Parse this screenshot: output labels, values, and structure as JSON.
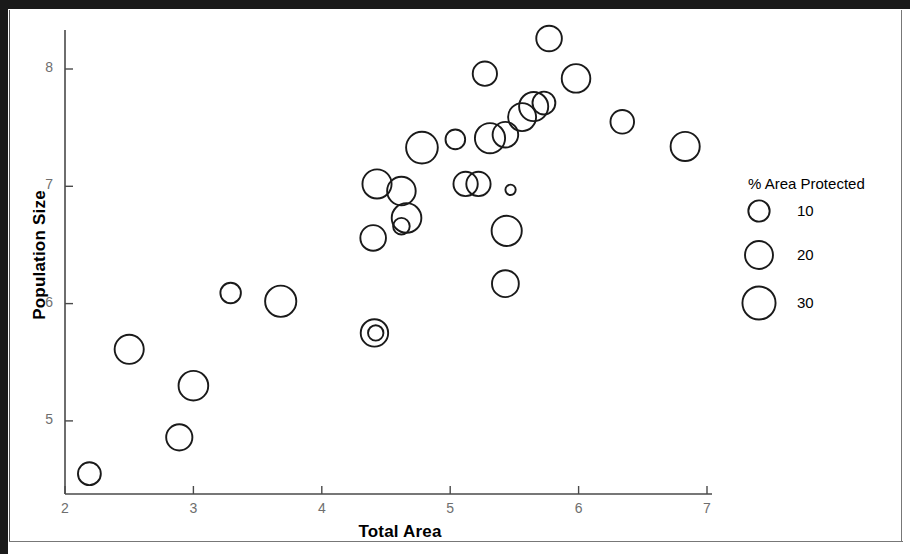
{
  "chart_data": {
    "type": "scatter",
    "title": "",
    "xlabel": "Total Area",
    "ylabel": "Population Size",
    "xlim": [
      1.85,
      7.3
    ],
    "ylim": [
      4.4,
      8.45
    ],
    "xticks": [
      2,
      3,
      4,
      5,
      6,
      7
    ],
    "yticks": [
      5,
      6,
      7,
      8
    ],
    "grid": false,
    "marker": "open-circle",
    "size_legend": {
      "title": "% Area Protected",
      "values": [
        10,
        20,
        30
      ],
      "position": "right"
    },
    "size_field": "% Area Protected",
    "points": [
      {
        "x": 2.19,
        "y": 4.55,
        "size": 12
      },
      {
        "x": 2.5,
        "y": 5.61,
        "size": 22
      },
      {
        "x": 2.89,
        "y": 4.86,
        "size": 17
      },
      {
        "x": 3.0,
        "y": 5.3,
        "size": 23
      },
      {
        "x": 3.29,
        "y": 6.09,
        "size": 9
      },
      {
        "x": 3.68,
        "y": 6.02,
        "size": 26
      },
      {
        "x": 4.41,
        "y": 5.75,
        "size": 19
      },
      {
        "x": 4.42,
        "y": 5.75,
        "size": 4
      },
      {
        "x": 4.4,
        "y": 6.56,
        "size": 16
      },
      {
        "x": 4.43,
        "y": 7.02,
        "size": 22
      },
      {
        "x": 4.62,
        "y": 6.96,
        "size": 21
      },
      {
        "x": 4.66,
        "y": 6.73,
        "size": 23
      },
      {
        "x": 4.62,
        "y": 6.66,
        "size": 5
      },
      {
        "x": 4.78,
        "y": 7.33,
        "size": 27
      },
      {
        "x": 5.04,
        "y": 7.4,
        "size": 8
      },
      {
        "x": 5.12,
        "y": 7.02,
        "size": 14
      },
      {
        "x": 5.22,
        "y": 7.02,
        "size": 14
      },
      {
        "x": 5.31,
        "y": 7.41,
        "size": 24
      },
      {
        "x": 5.43,
        "y": 7.44,
        "size": 16
      },
      {
        "x": 5.27,
        "y": 7.96,
        "size": 14
      },
      {
        "x": 5.44,
        "y": 6.62,
        "size": 24
      },
      {
        "x": 5.43,
        "y": 6.17,
        "size": 18
      },
      {
        "x": 5.47,
        "y": 6.97,
        "size": 1
      },
      {
        "x": 5.56,
        "y": 7.59,
        "size": 20
      },
      {
        "x": 5.65,
        "y": 7.68,
        "size": 22
      },
      {
        "x": 5.73,
        "y": 7.71,
        "size": 12
      },
      {
        "x": 5.77,
        "y": 8.26,
        "size": 16
      },
      {
        "x": 5.98,
        "y": 7.92,
        "size": 21
      },
      {
        "x": 6.34,
        "y": 7.55,
        "size": 13
      },
      {
        "x": 6.83,
        "y": 7.34,
        "size": 22
      }
    ]
  },
  "axes": {
    "x_title": "Total Area",
    "y_title": "Population Size",
    "x_tick_labels": [
      "2",
      "3",
      "4",
      "5",
      "6",
      "7"
    ],
    "y_tick_labels": [
      "5",
      "6",
      "7",
      "8"
    ]
  },
  "legend": {
    "title": "% Area Protected",
    "items": [
      {
        "label": "10",
        "size": 10
      },
      {
        "label": "20",
        "size": 20
      },
      {
        "label": "30",
        "size": 30
      }
    ]
  },
  "style": {
    "marker_stroke": "#1a1a1a",
    "axis_color": "#4a4a4a",
    "tick_label_color": "#6e6e6e",
    "background": "#ffffff"
  }
}
